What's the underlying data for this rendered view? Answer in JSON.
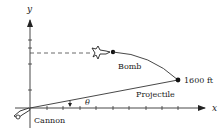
{
  "diagram": {
    "axes": {
      "x_label": "x",
      "y_label": "y"
    },
    "labels": {
      "bomb": "Bomb",
      "distance": "1600 ft",
      "projectile": "Projectile",
      "angle": "θ",
      "cannon": "Cannon"
    },
    "icons": {
      "plane": "airplane-icon",
      "cannon": "cannon-icon"
    },
    "colors": {
      "ink": "#222222",
      "background": "#ffffff"
    }
  }
}
